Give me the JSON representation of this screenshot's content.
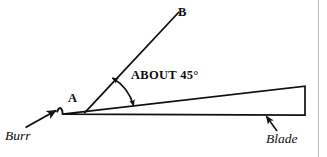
{
  "figure": {
    "background_color": "#ffffff",
    "ink_color": "#111111",
    "page_rule_color": "#b9b9b9",
    "labels": {
      "point_a": "A",
      "point_b": "B",
      "angle_note": "ABOUT 45°",
      "burr": "Burr",
      "blade": "Blade"
    },
    "annotations": {
      "angle_value_degrees": 45,
      "angle_qualifier": "ABOUT",
      "angle_between": "line AB and blade top face"
    },
    "geometry": {
      "blade_tip": [
        62,
        114
      ],
      "blade_spine_right": [
        305,
        86
      ],
      "blade_edge_right": [
        305,
        115
      ],
      "blade_right_edge_vertical": true,
      "line_ab_start": [
        85,
        112
      ],
      "line_ab_end": [
        178,
        13
      ],
      "angle_arc_center": [
        86,
        113
      ],
      "angle_arc_radius": 48,
      "burr_arrow_from": [
        26,
        127
      ],
      "burr_arrow_to": [
        57,
        110
      ],
      "blade_arrow_from": [
        276,
        131
      ],
      "blade_arrow_to": [
        266,
        117
      ],
      "page_rule_x": 318
    }
  }
}
